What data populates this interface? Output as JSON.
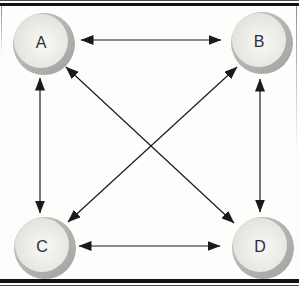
{
  "diagram": {
    "background": "#fdfdfb",
    "frame": {
      "thick_color": "#141414",
      "hairline_color": "#4d4d4d",
      "side_color": "#8f8f8f"
    },
    "node_style": {
      "radius": 31,
      "inner_radius": 27,
      "inner_offset": -3,
      "ring_light": "#c6c6c4",
      "ring_dark": "#a2a2a0",
      "inner_light": "#f8f8f6",
      "inner_dark": "#dbdbd6",
      "label_color": "#2e2e2e"
    },
    "edge_style": {
      "color": "#1a1a1a",
      "width": 1.2
    },
    "nodes": [
      {
        "id": "A",
        "label": "A",
        "x": 44,
        "y": 44
      },
      {
        "id": "B",
        "label": "B",
        "x": 262,
        "y": 43
      },
      {
        "id": "C",
        "label": "C",
        "x": 45,
        "y": 248
      },
      {
        "id": "D",
        "label": "D",
        "x": 263,
        "y": 248
      }
    ],
    "edges": [
      {
        "from": "A",
        "to": "B",
        "x1": 81,
        "y1": 40,
        "x2": 221,
        "y2": 40
      },
      {
        "from": "C",
        "to": "D",
        "x1": 79,
        "y1": 246,
        "x2": 220,
        "y2": 246
      },
      {
        "from": "A",
        "to": "C",
        "x1": 40,
        "y1": 78,
        "x2": 40,
        "y2": 213
      },
      {
        "from": "B",
        "to": "D",
        "x1": 260,
        "y1": 79,
        "x2": 260,
        "y2": 212
      },
      {
        "from": "A",
        "to": "D",
        "x1": 66,
        "y1": 67,
        "x2": 234,
        "y2": 223
      },
      {
        "from": "B",
        "to": "C",
        "x1": 237,
        "y1": 67,
        "x2": 68,
        "y2": 222
      }
    ]
  }
}
